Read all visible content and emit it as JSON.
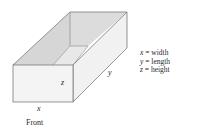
{
  "figure": {
    "type": "open-top box diagram",
    "edge_labels": {
      "x": "x",
      "y": "y",
      "z": "z"
    },
    "front_label": "Front",
    "legend": [
      {
        "var": "x",
        "eq": " = width"
      },
      {
        "var": "y",
        "eq": " = length"
      },
      {
        "var": "z",
        "eq": " = height"
      }
    ],
    "colors": {
      "stroke": "#7a7a7a",
      "front_face": "#f4f4f4",
      "side_face": "#f1f1f1",
      "inner_wall": "#dcdcdc",
      "inner_floor": "#e6e6e6",
      "text": "#2a2a2a"
    }
  }
}
